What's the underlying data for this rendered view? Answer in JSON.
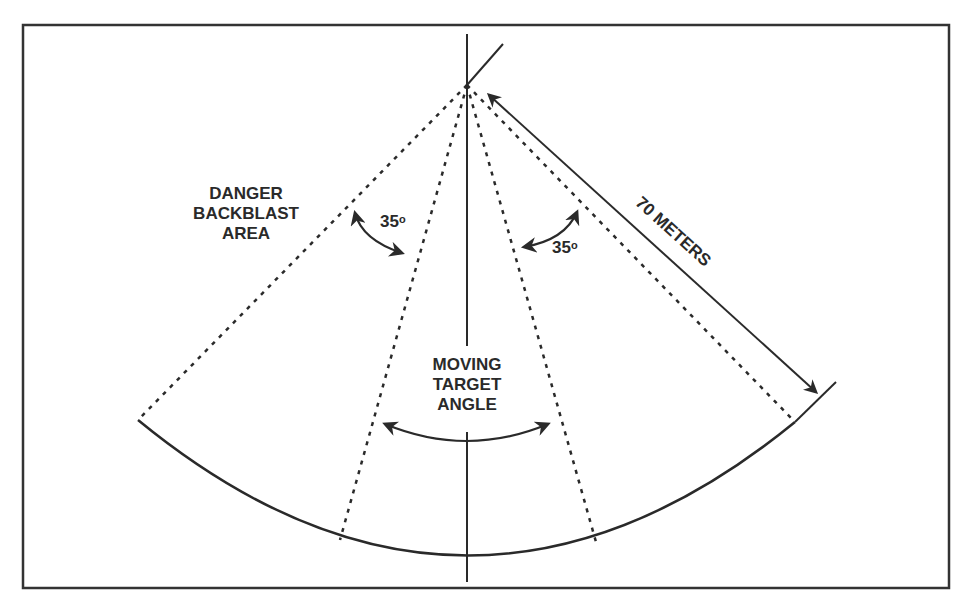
{
  "figure": {
    "labels": {
      "danger_area": [
        "DANGER",
        "BACKBLAST",
        "AREA"
      ],
      "left_angle": {
        "value": "35",
        "unit": "o"
      },
      "right_angle": {
        "value": "35",
        "unit": "o"
      },
      "distance": "70 METERS",
      "moving_target": [
        "MOVING",
        "TARGET",
        "ANGLE"
      ]
    },
    "colors": {
      "line": "#2a2a2a",
      "background": "#ffffff",
      "border": "#333333"
    }
  }
}
